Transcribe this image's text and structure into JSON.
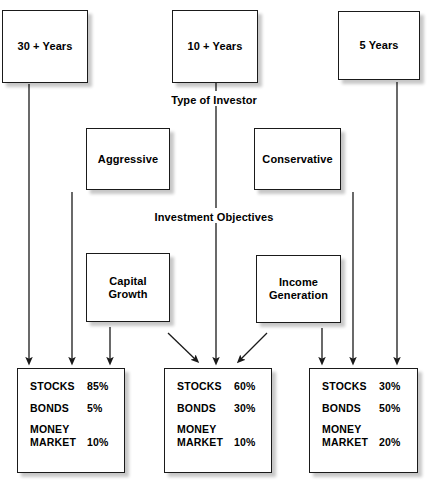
{
  "diagram": {
    "stages": [
      {
        "caption": "Type of Investor"
      },
      {
        "caption": "Investment Objectives"
      }
    ],
    "time_horizons": [
      {
        "label": "30 + Years"
      },
      {
        "label": "10 + Years"
      },
      {
        "label": "5 Years"
      }
    ],
    "investor_types": [
      {
        "label": "Aggressive"
      },
      {
        "label": "Conservative"
      }
    ],
    "objectives": [
      {
        "label": "Capital\nGrowth"
      },
      {
        "label": "Income\nGeneration"
      }
    ],
    "allocations": [
      {
        "name": "aggressive-allocation",
        "rows": [
          {
            "asset": "STOCKS",
            "pct": "85%"
          },
          {
            "asset": "BONDS",
            "pct": "5%"
          },
          {
            "asset": "MONEY\nMARKET",
            "pct": "10%"
          }
        ]
      },
      {
        "name": "balanced-allocation",
        "rows": [
          {
            "asset": "STOCKS",
            "pct": "60%"
          },
          {
            "asset": "BONDS",
            "pct": "30%"
          },
          {
            "asset": "MONEY\nMARKET",
            "pct": "10%"
          }
        ]
      },
      {
        "name": "conservative-allocation",
        "rows": [
          {
            "asset": "STOCKS",
            "pct": "30%"
          },
          {
            "asset": "BONDS",
            "pct": "50%"
          },
          {
            "asset": "MONEY\nMARKET",
            "pct": "20%"
          }
        ]
      }
    ],
    "colors": {
      "box_border": "#1a1a1a",
      "box_fill": "#ffffff",
      "connector": "#1a1a1a",
      "text": "#000000",
      "background": "#ffffff"
    }
  }
}
